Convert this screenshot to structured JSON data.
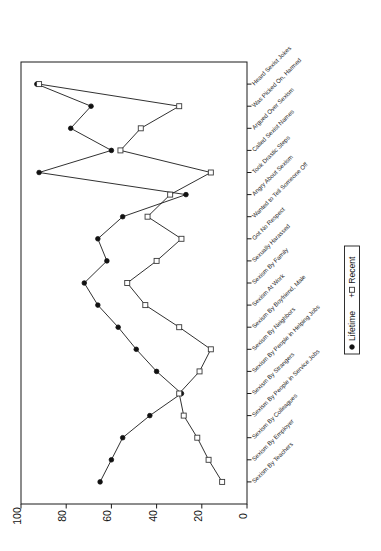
{
  "chart_data": {
    "type": "line",
    "title": "",
    "subtitle": "",
    "xlabel": "",
    "ylabel": "",
    "orientation": "horizontal-categories-on-vertical-axis",
    "xlim": [
      100,
      0
    ],
    "xticks": [
      "100",
      "80",
      "60",
      "40",
      "20",
      "0"
    ],
    "xtick_values": [
      100,
      80,
      60,
      40,
      20,
      0
    ],
    "axis_reversed": true,
    "grid": false,
    "legend_position": "right-middle",
    "categories": [
      "Heard Sexist Jokes",
      "Was Picked On, Harmed",
      "Argued Over Sexism",
      "Called Sexist Names",
      "Took Drastic Steps",
      "Angry About Sexism",
      "Wanted to Tell Someone Off",
      "Got No Respect",
      "Sexually Harassed",
      "Sexism By Family",
      "Sexism At Work",
      "Sexism By Boyfriend, Male",
      "Sexism By Neighbors",
      "Sexism By People in Helping Jobs",
      "Sexism By Strangers",
      "Sexism By People in Service Jobs",
      "Sexism By Colleagues",
      "Sexism By Employer",
      "Sexism By Teachers"
    ],
    "series": [
      {
        "name": "Lifetime",
        "marker": "filled-circle",
        "values": [
          93,
          69,
          78,
          60,
          92,
          27,
          55,
          66,
          62,
          72,
          66,
          57,
          49,
          40,
          29,
          43,
          55,
          60,
          65
        ]
      },
      {
        "name": "Recent",
        "marker": "open-square",
        "values": [
          92,
          30,
          47,
          56,
          16,
          34,
          44,
          29,
          40,
          53,
          45,
          30,
          16,
          21,
          30,
          28,
          22,
          17,
          11
        ]
      }
    ]
  },
  "legend": {
    "entries": [
      {
        "label": "Lifetime",
        "marker": "filled-circle"
      },
      {
        "label": "Recent",
        "marker": "open-square"
      }
    ],
    "separator": "+"
  }
}
